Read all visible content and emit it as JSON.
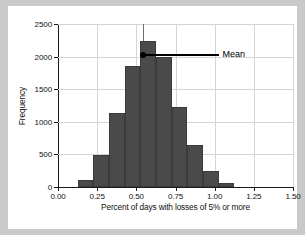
{
  "chart_data": {
    "type": "bar",
    "title": "",
    "subtitle": "",
    "xlabel": "Percent of days with losses of 5% or more",
    "ylabel": "Frequency",
    "xlim": [
      0.0,
      1.5
    ],
    "ylim": [
      0,
      2500
    ],
    "xticks": [
      "0.00",
      "0.25",
      "0.50",
      "0.75",
      "1.00",
      "1.25",
      "1.50"
    ],
    "xtick_values": [
      0.0,
      0.25,
      0.5,
      0.75,
      1.0,
      1.25,
      1.5
    ],
    "yticks": [
      "0",
      "500",
      "1000",
      "1500",
      "2000",
      "2500"
    ],
    "ytick_values": [
      0,
      500,
      1000,
      1500,
      2000,
      2500
    ],
    "grid": true,
    "legend": "none",
    "bin_width": 0.1,
    "bin_starts": [
      0.125,
      0.225,
      0.325,
      0.425,
      0.525,
      0.625,
      0.725,
      0.825,
      0.925,
      1.025
    ],
    "categories": [
      "0.125-0.225",
      "0.225-0.325",
      "0.325-0.425",
      "0.425-0.525",
      "0.525-0.625",
      "0.625-0.725",
      "0.725-0.825",
      "0.825-0.925",
      "0.925-1.025",
      "1.025-1.125"
    ],
    "values": [
      100,
      490,
      1130,
      1850,
      2240,
      1990,
      1220,
      650,
      240,
      55
    ],
    "bar_color": "#4a4a4a",
    "annotations": [
      {
        "label": "Mean",
        "x": 0.545,
        "y": 2020,
        "marker": "dot",
        "color": "#000000"
      }
    ],
    "reference_line": {
      "x": 0.545,
      "y_top": 2500,
      "color": "#6e6e6e"
    }
  },
  "figure": {
    "background": "#ffffff",
    "outer_background": "#c9c9c9",
    "axis_color": "#1a1a1a",
    "grid_color": "#d4d4d4"
  }
}
